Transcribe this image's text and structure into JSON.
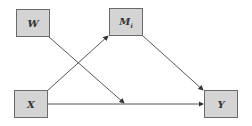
{
  "diagram": {
    "type": "moderated mediation path diagram",
    "nodes": [
      {
        "id": "W",
        "label": "W",
        "subscript": ""
      },
      {
        "id": "X",
        "label": "X",
        "subscript": ""
      },
      {
        "id": "M",
        "label": "M",
        "subscript": "i"
      },
      {
        "id": "Y",
        "label": "Y",
        "subscript": ""
      }
    ],
    "edges": [
      {
        "from": "X",
        "to": "M"
      },
      {
        "from": "M",
        "to": "Y"
      },
      {
        "from": "X",
        "to": "Y"
      },
      {
        "from": "W",
        "to": "X-Y path"
      }
    ],
    "colors": {
      "box_fill": "#d4d4d4",
      "box_border": "#6a6a6a",
      "arrow": "#333333"
    }
  }
}
